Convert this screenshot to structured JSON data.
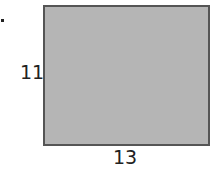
{
  "figure": {
    "bullet": "•",
    "shape": "rectangle",
    "fill_color": "#b5b5b5",
    "border_color": "#555555",
    "side_labels": {
      "height": "11",
      "width": "13"
    }
  }
}
